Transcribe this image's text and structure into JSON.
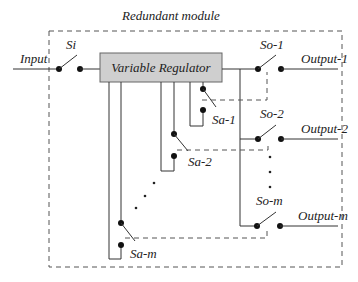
{
  "diagram": {
    "title": "Redundant module",
    "regulator_label": "Variable Regulator",
    "input_label": "Input",
    "input_switch_label": "Si",
    "output_switches": [
      {
        "label": "So-1",
        "output_label": "Output-1"
      },
      {
        "label": "So-2",
        "output_label": "Output-2"
      },
      {
        "label": "So-m",
        "output_label": "Output-m"
      }
    ],
    "auxiliary_switches": [
      {
        "label": "Sa-1"
      },
      {
        "label": "Sa-2"
      },
      {
        "label": "Sa-m"
      }
    ],
    "colors": {
      "regulator_fill": "#cfcfcf",
      "regulator_stroke": "#666666",
      "line": "#333333",
      "dashed_border": "#555555"
    }
  }
}
